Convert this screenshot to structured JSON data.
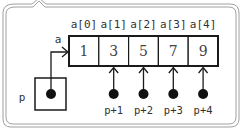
{
  "diagram": {
    "array": {
      "name": "a",
      "index_labels": [
        "a[0]",
        "a[1]",
        "a[2]",
        "a[3]",
        "a[4]"
      ],
      "values": [
        "1",
        "3",
        "5",
        "7",
        "9"
      ]
    },
    "pointer": {
      "name": "p",
      "points_to_index": 0
    },
    "offset_pointers": [
      {
        "label": "p+1",
        "points_to_index": 1
      },
      {
        "label": "p+2",
        "points_to_index": 2
      },
      {
        "label": "p+3",
        "points_to_index": 3
      },
      {
        "label": "p+4",
        "points_to_index": 4
      }
    ],
    "colors": {
      "stroke": "#1a1a1a",
      "frame": "#9a9a9a",
      "text": "#333333",
      "background": "#ffffff"
    }
  }
}
